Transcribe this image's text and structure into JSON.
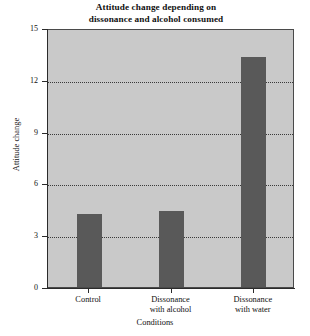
{
  "chart_data": {
    "type": "bar",
    "title": "Attitude change depending on dissonance and alcohol consumed",
    "title_lines": [
      "Attitude change depending on",
      "dissonance and alcohol consumed"
    ],
    "categories": [
      "Control",
      "Dissonance with alcohol",
      "Dissonance with water"
    ],
    "category_lines": [
      [
        "Control"
      ],
      [
        "Dissonance",
        "with alcohol"
      ],
      [
        "Dissonance",
        "with water"
      ]
    ],
    "values": [
      4.2,
      4.4,
      13.3
    ],
    "xlabel": "Conditions",
    "ylabel": "Attitude change",
    "ylim": [
      0,
      15
    ],
    "yticks": [
      0,
      3,
      6,
      9,
      12,
      15
    ],
    "ytick_labels": [
      "0",
      "3",
      "6",
      "9",
      "12",
      "15"
    ],
    "grid": true,
    "grid_axis": "y",
    "legend": null,
    "colors": {
      "bar": "#595959",
      "plot_background": "#c9c9c9",
      "page_background": "#ffffff",
      "axis": "#2b2b2b",
      "gridline": "#3a3a3a",
      "text": "#111111"
    }
  }
}
